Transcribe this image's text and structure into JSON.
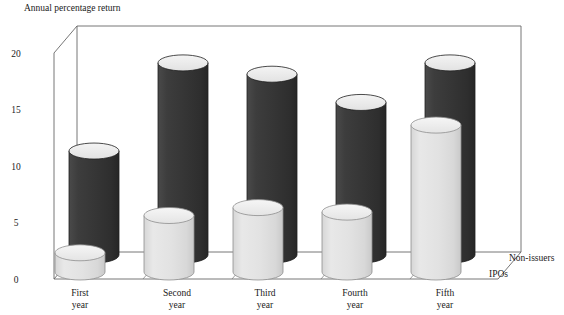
{
  "chart_data": {
    "type": "bar",
    "title": "",
    "ylabel": "Annual percentage return",
    "xlabel": "",
    "categories": [
      "First\nyear",
      "Second\nyear",
      "Third\nyear",
      "Fourth\nyear",
      "Fifth\nyear"
    ],
    "category_lines": [
      [
        "First",
        "year"
      ],
      [
        "Second",
        "year"
      ],
      [
        "Third",
        "year"
      ],
      [
        "Fourth",
        "year"
      ],
      [
        "Fifth",
        "year"
      ]
    ],
    "ylim": [
      0,
      20
    ],
    "yticks": [
      0,
      5,
      10,
      15,
      20
    ],
    "ytick_labels": [
      "0",
      "5",
      "10",
      "15",
      "20"
    ],
    "grid": false,
    "legend_position": "right",
    "style": "3d-cylinder",
    "series": [
      {
        "name": "Non-issuers",
        "color": "#3a3a3a",
        "top_color": "#eeeeee",
        "values": [
          9.2,
          17.0,
          16.0,
          13.5,
          17.0
        ]
      },
      {
        "name": "IPOs",
        "color": "#e2e2e2",
        "top_color": "#f2f2f2",
        "values": [
          1.7,
          5.0,
          5.7,
          5.3,
          13.0
        ]
      }
    ]
  },
  "legend": {
    "items": [
      {
        "label": "Non-issuers"
      },
      {
        "label": "IPOs"
      }
    ]
  },
  "axis": {
    "y_title": "Annual percentage return"
  },
  "colors": {
    "non_issuers": "#3a3a3a",
    "ipos": "#e2e2e2",
    "frame": "#555555",
    "text": "#1a1a1a"
  }
}
